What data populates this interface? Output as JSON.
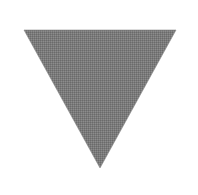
{
  "shape": {
    "type": "triangle-down",
    "icon": "triangle-down-icon",
    "fill": "#7a7a7a",
    "edge": "#8a8a8a",
    "points": [
      [
        24,
        30
      ],
      [
        176,
        30
      ],
      [
        100,
        168
      ]
    ]
  }
}
